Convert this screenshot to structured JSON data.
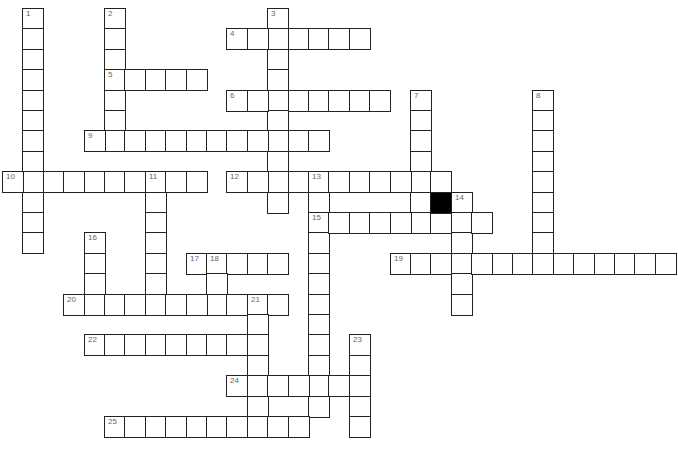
{
  "puzzle": {
    "type": "crossword",
    "grid": {
      "origin_x": 2,
      "origin_y": 8,
      "cell_size": 20.4
    },
    "entries": [
      {
        "number": "1",
        "dir": "down",
        "col": 1,
        "row": 0,
        "len": 12
      },
      {
        "number": "2",
        "dir": "down",
        "col": 5,
        "row": 0,
        "len": 7
      },
      {
        "number": "3",
        "dir": "down",
        "col": 13,
        "row": 0,
        "len": 10
      },
      {
        "number": "4",
        "dir": "across",
        "col": 11,
        "row": 1,
        "len": 7
      },
      {
        "number": "5",
        "dir": "across",
        "col": 5,
        "row": 3,
        "len": 5
      },
      {
        "number": "6",
        "dir": "across",
        "col": 11,
        "row": 4,
        "len": 8
      },
      {
        "number": "7",
        "dir": "down",
        "col": 20,
        "row": 4,
        "len": 7
      },
      {
        "number": "8",
        "dir": "down",
        "col": 26,
        "row": 4,
        "len": 8
      },
      {
        "number": "9",
        "dir": "across",
        "col": 4,
        "row": 6,
        "len": 12
      },
      {
        "number": "10",
        "dir": "across",
        "col": 0,
        "row": 8,
        "len": 10
      },
      {
        "number": "11",
        "dir": "down",
        "col": 7,
        "row": 8,
        "len": 7
      },
      {
        "number": "12",
        "dir": "across",
        "col": 11,
        "row": 8,
        "len": 11
      },
      {
        "number": "13",
        "dir": "down",
        "col": 15,
        "row": 8,
        "len": 12
      },
      {
        "number": "14",
        "dir": "down",
        "col": 22,
        "row": 9,
        "len": 6
      },
      {
        "number": "15",
        "dir": "across",
        "col": 15,
        "row": 10,
        "len": 9
      },
      {
        "number": "16",
        "dir": "down",
        "col": 4,
        "row": 11,
        "len": 4
      },
      {
        "number": "17",
        "dir": "across",
        "col": 9,
        "row": 12,
        "len": 5
      },
      {
        "number": "18",
        "dir": "down",
        "col": 10,
        "row": 12,
        "len": 3
      },
      {
        "number": "19",
        "dir": "across",
        "col": 19,
        "row": 12,
        "len": 14
      },
      {
        "number": "20",
        "dir": "across",
        "col": 3,
        "row": 14,
        "len": 11
      },
      {
        "number": "21",
        "dir": "down",
        "col": 12,
        "row": 14,
        "len": 6
      },
      {
        "number": "22",
        "dir": "across",
        "col": 4,
        "row": 16,
        "len": 9
      },
      {
        "number": "23",
        "dir": "down",
        "col": 17,
        "row": 16,
        "len": 5
      },
      {
        "number": "24",
        "dir": "across",
        "col": 11,
        "row": 18,
        "len": 7
      },
      {
        "number": "25",
        "dir": "across",
        "col": 5,
        "row": 20,
        "len": 10
      }
    ],
    "black_cells": [
      {
        "col": 21,
        "row": 9
      }
    ]
  }
}
